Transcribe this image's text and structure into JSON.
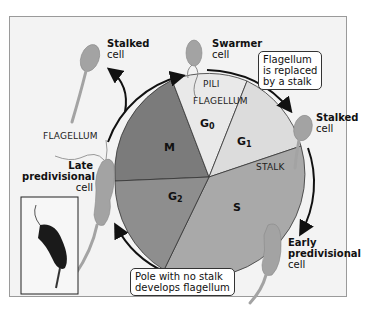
{
  "diagram": {
    "phases": [
      {
        "id": "M",
        "label": "M",
        "sub": "",
        "color": "#7b7b7b"
      },
      {
        "id": "G0",
        "label": "G",
        "sub": "0",
        "color": "#e9e9e9"
      },
      {
        "id": "G1",
        "label": "G",
        "sub": "1",
        "color": "#dcdcdc"
      },
      {
        "id": "S",
        "label": "S",
        "sub": "",
        "color": "#a9a9a9"
      },
      {
        "id": "G2",
        "label": "G",
        "sub": "2",
        "color": "#8e8e8e"
      }
    ],
    "cells": {
      "stalked_top_left": {
        "bold": "Stalked",
        "normal": "cell"
      },
      "swarmer": {
        "bold": "Swarmer",
        "normal": "cell"
      },
      "stalked_right": {
        "bold": "Stalked",
        "normal": "cell"
      },
      "early_predivisional": {
        "bold1": "Early",
        "bold2": "predivisional",
        "normal": "cell"
      },
      "late_predivisional": {
        "bold1": "Late",
        "bold2": "predivisional",
        "normal": "cell"
      }
    },
    "structure_labels": {
      "pili": "PILI",
      "flagellum_top": "FLAGELLUM",
      "flagellum_left": "FLAGELLUM",
      "stalk": "STALK"
    },
    "callouts": {
      "top": [
        "Flagellum",
        "is replaced",
        "by a stalk"
      ],
      "bottom": [
        "Pole with no stalk",
        "develops flagellum"
      ]
    },
    "colors": {
      "frame_bg": "#f3f3f3",
      "frame_border": "#9a9a9a",
      "cell_fill": "#a3a3a3",
      "arrow": "#111111"
    }
  }
}
